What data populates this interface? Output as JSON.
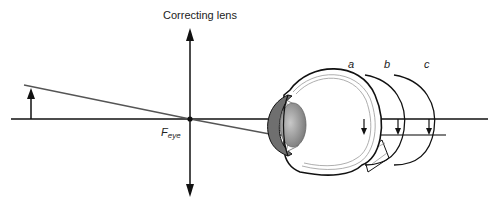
{
  "diagram": {
    "title": "Correcting lens",
    "focal_label": "F",
    "focal_subscript": "eye",
    "retina_positions": [
      {
        "label": "a"
      },
      {
        "label": "b"
      },
      {
        "label": "c"
      }
    ],
    "colors": {
      "line": "#111111",
      "ray": "#555555",
      "lens_gray": "#999999",
      "cornea_gray": "#7a7a7a"
    }
  }
}
